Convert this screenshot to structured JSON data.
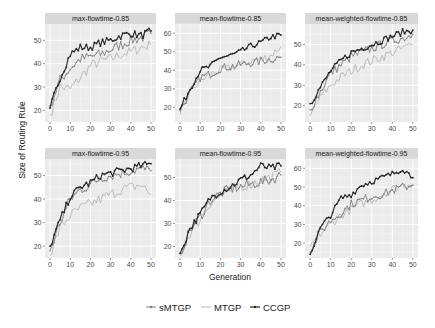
{
  "chart_data": {
    "type": "line",
    "layout": "facet_wrap 2x3",
    "xlabel": "Generation",
    "ylabel": "Size of Routing Rule",
    "legend": {
      "position": "bottom",
      "entries": [
        "sMTGP",
        "MTGP",
        "CCGP"
      ]
    },
    "series_style": {
      "sMTGP": {
        "color": "#7f7f7f",
        "points": true
      },
      "MTGP": {
        "color": "#b5b5b5",
        "points": false
      },
      "CCGP": {
        "color": "#262626",
        "points": true
      }
    },
    "x_anchor": [
      0,
      5,
      10,
      15,
      20,
      25,
      30,
      35,
      40,
      45,
      50
    ],
    "x_ticks": [
      0,
      10,
      20,
      30,
      40,
      50
    ],
    "panels": [
      {
        "title": "max-flowtime-0.85",
        "ylim": [
          15,
          57
        ],
        "y_ticks": [
          20,
          30,
          40,
          50
        ],
        "series": [
          {
            "name": "sMTGP",
            "values": [
              22,
              33,
              38,
              42,
              43,
              44,
              46,
              48,
              50,
              51,
              53
            ]
          },
          {
            "name": "MTGP",
            "values": [
              18,
              30,
              29,
              34,
              39,
              41,
              42,
              44,
              45,
              47,
              48
            ]
          },
          {
            "name": "CCGP",
            "values": [
              21,
              34,
              44,
              47,
              47,
              49,
              50,
              52,
              53,
              52,
              54
            ]
          }
        ]
      },
      {
        "title": "mean-flowtime-0.85",
        "ylim": [
          12,
          65
        ],
        "y_ticks": [
          20,
          30,
          40,
          50,
          60
        ],
        "series": [
          {
            "name": "sMTGP",
            "values": [
              18,
              28,
              36,
              38,
              41,
              42,
              43,
              44,
              45,
              46,
              47
            ]
          },
          {
            "name": "MTGP",
            "values": [
              16,
              29,
              34,
              38,
              40,
              41,
              43,
              45,
              46,
              48,
              53
            ]
          },
          {
            "name": "CCGP",
            "values": [
              19,
              30,
              40,
              42,
              47,
              48,
              50,
              53,
              55,
              58,
              59
            ]
          }
        ]
      },
      {
        "title": "mean-weighted-flowtime-0.85",
        "ylim": [
          12,
          60
        ],
        "y_ticks": [
          20,
          30,
          40,
          50
        ],
        "series": [
          {
            "name": "sMTGP",
            "values": [
              18,
              27,
              36,
              40,
              44,
              46,
              48,
              50,
              52,
              53,
              55
            ]
          },
          {
            "name": "MTGP",
            "values": [
              15,
              24,
              30,
              34,
              37,
              40,
              42,
              44,
              46,
              48,
              50
            ]
          },
          {
            "name": "CCGP",
            "values": [
              21,
              29,
              37,
              42,
              46,
              48,
              50,
              52,
              54,
              56,
              57
            ]
          }
        ]
      },
      {
        "title": "max-flowtime-0.95",
        "ylim": [
          15,
          57
        ],
        "y_ticks": [
          20,
          30,
          40,
          50
        ],
        "series": [
          {
            "name": "sMTGP",
            "values": [
              18,
              30,
              40,
              44,
              46,
              49,
              50,
              51,
              52,
              53,
              52
            ]
          },
          {
            "name": "MTGP",
            "values": [
              16,
              28,
              33,
              36,
              38,
              40,
              42,
              44,
              45,
              46,
              42
            ]
          },
          {
            "name": "CCGP",
            "values": [
              20,
              31,
              41,
              45,
              47,
              50,
              51,
              52,
              53,
              54,
              55
            ]
          }
        ]
      },
      {
        "title": "mean-flowtime-0.95",
        "ylim": [
          15,
          58
        ],
        "y_ticks": [
          20,
          30,
          40,
          50
        ],
        "series": [
          {
            "name": "sMTGP",
            "values": [
              17,
              27,
              33,
              40,
              43,
              45,
              46,
              47,
              48,
              49,
              51
            ]
          },
          {
            "name": "MTGP",
            "values": [
              16,
              26,
              32,
              39,
              42,
              44,
              46,
              47,
              49,
              50,
              52
            ]
          },
          {
            "name": "CCGP",
            "values": [
              17,
              28,
              34,
              41,
              44,
              46,
              49,
              51,
              55,
              54,
              55
            ]
          }
        ]
      },
      {
        "title": "mean-weighted-flowtime-0.95",
        "ylim": [
          12,
          65
        ],
        "y_ticks": [
          20,
          30,
          40,
          50,
          60
        ],
        "series": [
          {
            "name": "sMTGP",
            "values": [
              15,
              26,
              32,
              36,
              41,
              43,
              45,
              46,
              48,
              50,
              51
            ]
          },
          {
            "name": "MTGP",
            "values": [
              18,
              25,
              30,
              35,
              38,
              41,
              43,
              46,
              49,
              51,
              52
            ]
          },
          {
            "name": "CCGP",
            "values": [
              14,
              28,
              35,
              44,
              46,
              51,
              53,
              55,
              57,
              60,
              55
            ]
          }
        ]
      }
    ]
  }
}
